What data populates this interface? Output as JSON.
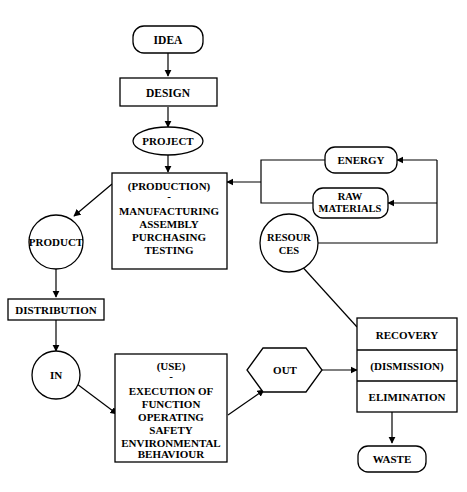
{
  "diagram": {
    "type": "flowchart",
    "stroke_color": "#000000",
    "fill_color": "#ffffff",
    "nodes": {
      "idea": {
        "label": "IDEA",
        "shape": "rounded-rect"
      },
      "design": {
        "label": "DESIGN",
        "shape": "rect"
      },
      "project": {
        "label": "PROJECT",
        "shape": "ellipse"
      },
      "production": {
        "shape": "rect",
        "heading": "(PRODUCTION)",
        "separator": "-",
        "lines": [
          "MANUFACTURING",
          "ASSEMBLY",
          "PURCHASING",
          "TESTING"
        ]
      },
      "product": {
        "label": "PRODUCT",
        "shape": "circle"
      },
      "distribution": {
        "label": "DISTRIBUTION",
        "shape": "rect"
      },
      "in": {
        "label": "IN",
        "shape": "circle"
      },
      "use": {
        "shape": "rect",
        "heading": "(USE)",
        "separator": "-",
        "lines": [
          "EXECUTION OF",
          "FUNCTION",
          "OPERATING",
          "SAFETY",
          "ENVIRONMENTAL",
          "BEHAVIOUR"
        ]
      },
      "out": {
        "label": "OUT",
        "shape": "hexagon"
      },
      "energy": {
        "label": "ENERGY",
        "shape": "rounded-rect"
      },
      "raw_materials": {
        "line1": "RAW",
        "line2": "MATERIALS",
        "shape": "rounded-rect"
      },
      "resources": {
        "line1": "RESOUR",
        "line2": "CES",
        "shape": "circle"
      },
      "disposal": {
        "shape": "stacked-rect",
        "rows": [
          "RECOVERY",
          "(DISMISSION)",
          "ELIMINATION"
        ]
      },
      "waste": {
        "label": "WASTE",
        "shape": "rounded-rect"
      }
    },
    "edges": [
      {
        "from": "idea",
        "to": "design",
        "style": "straight-down"
      },
      {
        "from": "design",
        "to": "project",
        "style": "straight-down"
      },
      {
        "from": "project",
        "to": "production",
        "style": "straight-down"
      },
      {
        "from": "production",
        "to": "product",
        "style": "diagonal"
      },
      {
        "from": "product",
        "to": "distribution",
        "style": "straight-down"
      },
      {
        "from": "distribution",
        "to": "in",
        "style": "straight-down"
      },
      {
        "from": "in",
        "to": "use",
        "style": "diagonal"
      },
      {
        "from": "use",
        "to": "out",
        "style": "diagonal"
      },
      {
        "from": "out",
        "to": "disposal",
        "style": "straight-right"
      },
      {
        "from": "disposal",
        "to": "waste",
        "style": "straight-down"
      },
      {
        "from": "disposal",
        "to": "resources",
        "style": "diagonal"
      },
      {
        "from": "resources",
        "to": "energy",
        "style": "orthogonal"
      },
      {
        "from": "resources",
        "to": "raw_materials",
        "style": "orthogonal"
      },
      {
        "from": "energy",
        "to": "production",
        "style": "orthogonal"
      },
      {
        "from": "raw_materials",
        "to": "production",
        "style": "orthogonal"
      }
    ]
  }
}
